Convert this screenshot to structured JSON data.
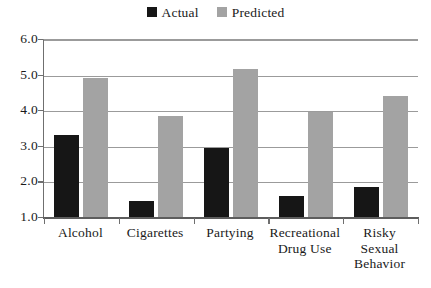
{
  "chart_data": {
    "type": "bar",
    "title": "",
    "subtitle": "",
    "xlabel": "",
    "ylabel": "",
    "categories": [
      "Alcohol",
      "Cigarettes",
      "Partying",
      "Recreational Drug Use",
      "Risky Sexual Behavior"
    ],
    "category_lines": [
      [
        "Alcohol"
      ],
      [
        "Cigarettes"
      ],
      [
        "Partying"
      ],
      [
        "Recreational",
        "Drug Use"
      ],
      [
        "Risky",
        "Sexual",
        "Behavior"
      ]
    ],
    "series": [
      {
        "name": "Actual",
        "color": "#161616",
        "values": [
          3.3,
          1.45,
          2.95,
          1.6,
          1.85
        ]
      },
      {
        "name": "Predicted",
        "color": "#a3a3a3",
        "values": [
          4.9,
          3.85,
          5.15,
          3.95,
          4.4
        ]
      }
    ],
    "ylim": [
      1.0,
      6.0
    ],
    "ytick_labels": [
      "6.0",
      "5.0",
      "4.0",
      "3.0",
      "2.0",
      "1.0"
    ],
    "ytick_values": [
      6.0,
      5.0,
      4.0,
      3.0,
      2.0,
      1.0
    ],
    "grid": "horizontal",
    "legend_position": "top-center",
    "legend": [
      {
        "label": "Actual",
        "color": "#161616"
      },
      {
        "label": "Predicted",
        "color": "#a3a3a3"
      }
    ],
    "colors": {
      "actual": "#161616",
      "predicted": "#a3a3a3",
      "gridline": "#9b9b9b",
      "axis": "#6f6f6f",
      "background": "#ffffff"
    }
  }
}
